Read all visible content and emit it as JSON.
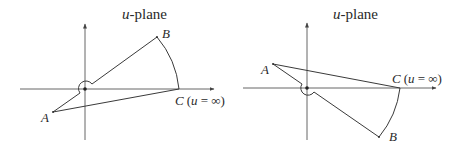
{
  "panels": [
    {
      "id": "left",
      "title_var": "u",
      "title_rest": "-plane",
      "labels": {
        "A": "A",
        "B": "B",
        "C_main": "C",
        "C_paren": "(",
        "C_var": "u",
        "C_eq": " = ∞)"
      },
      "geometry": {
        "origin": [
          85,
          89
        ],
        "A": [
          53,
          112
        ],
        "B": [
          157,
          37
        ],
        "C": [
          179,
          89
        ],
        "x_axis": [
          20,
          215
        ],
        "y_axis": [
          23,
          140
        ],
        "indent": "above-left"
      }
    },
    {
      "id": "right",
      "title_var": "u",
      "title_rest": "-plane",
      "labels": {
        "A": "A",
        "B": "B",
        "C_main": "C",
        "C_paren": "(",
        "C_var": "u",
        "C_eq": " = ∞)"
      },
      "geometry": {
        "origin": [
          307,
          88
        ],
        "A": [
          273,
          64
        ],
        "B": [
          379,
          137
        ],
        "C": [
          400,
          88
        ],
        "x_axis": [
          243,
          437
        ],
        "y_axis": [
          22,
          140
        ],
        "indent": "below-left"
      }
    }
  ]
}
